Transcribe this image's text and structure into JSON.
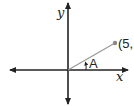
{
  "diagram": {
    "type": "coordinate-plane-angle",
    "axes": {
      "x_label": "x",
      "y_label": "y"
    },
    "point": {
      "label": "(5,",
      "color": "#888888"
    },
    "angle": {
      "label": "A"
    },
    "colors": {
      "axis": "#222222",
      "ray": "#999999",
      "text": "#222222"
    }
  }
}
